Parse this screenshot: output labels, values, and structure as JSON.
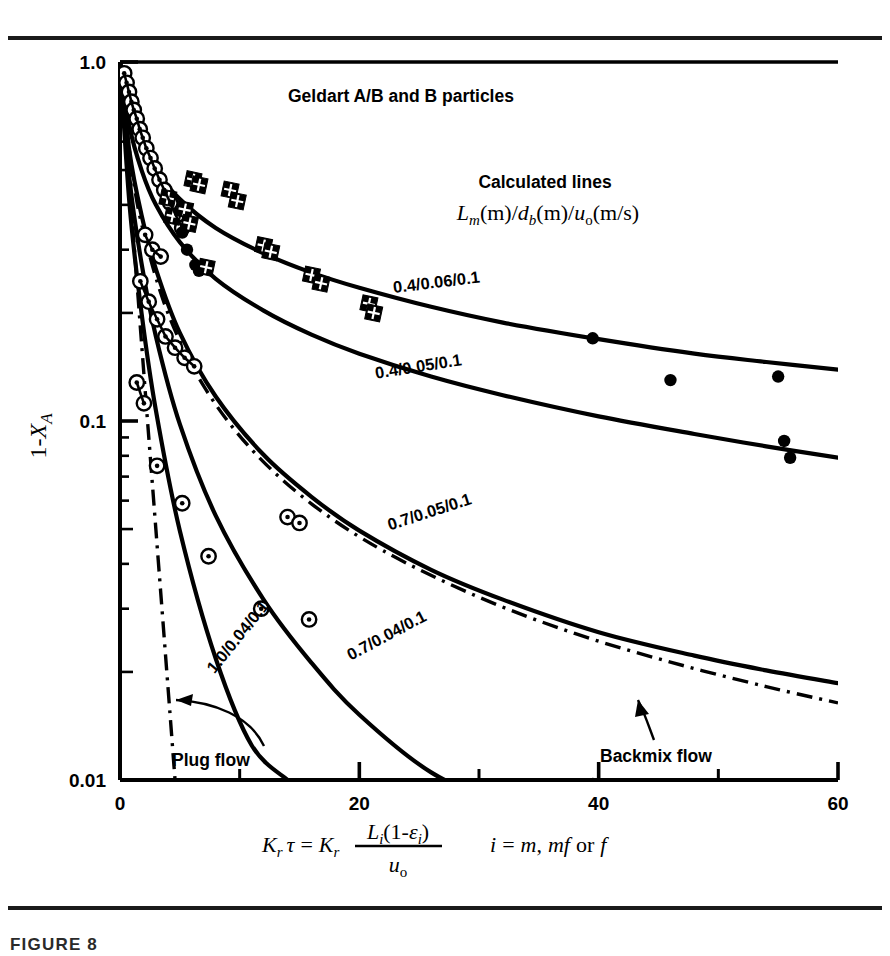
{
  "figure": {
    "caption": "FIGURE 8"
  },
  "chart_data": {
    "type": "scatter",
    "title": "Geldart A/B and B particles",
    "xlabel": "Kr tau = Kr Li(1-epsilon_i)/uo,  i = m, mf or f",
    "ylabel": "1-XA",
    "xscale": "linear",
    "yscale": "log",
    "xlim": [
      0,
      60
    ],
    "ylim": [
      0.01,
      1.0
    ],
    "grid": false,
    "x_ticks_major": [
      "0",
      "20",
      "40",
      "60"
    ],
    "x_tick_values_major": [
      0,
      20,
      40,
      60
    ],
    "x_ticks_minor": [
      10,
      30,
      50
    ],
    "y_ticks_major": [
      "1.0",
      "0.1",
      "0.01"
    ],
    "y_tick_values_major": [
      1.0,
      0.1,
      0.01
    ],
    "legend_heading": "Calculated lines",
    "legend_formula": "Lm(m)/db(m)/uo(m/s)",
    "annotations": {
      "plug_flow": "Plug flow",
      "backmix_flow": "Backmix flow"
    },
    "series": [
      {
        "name": "0.4/0.06/0.1",
        "kind": "calculated-line",
        "label": "0.4/0.06/0.1",
        "label_x": 26.5,
        "label_y": 0.235,
        "label_rotation": -7,
        "points": [
          {
            "x": 0.0,
            "y": 1.0
          },
          {
            "x": 0.8,
            "y": 0.74
          },
          {
            "x": 1.8,
            "y": 0.6
          },
          {
            "x": 3.0,
            "y": 0.5
          },
          {
            "x": 5.0,
            "y": 0.415
          },
          {
            "x": 8.0,
            "y": 0.345
          },
          {
            "x": 12.0,
            "y": 0.293
          },
          {
            "x": 16.0,
            "y": 0.259
          },
          {
            "x": 20.0,
            "y": 0.235
          },
          {
            "x": 26.0,
            "y": 0.208
          },
          {
            "x": 32.0,
            "y": 0.188
          },
          {
            "x": 40.0,
            "y": 0.169
          },
          {
            "x": 48.0,
            "y": 0.154
          },
          {
            "x": 54.0,
            "y": 0.146
          },
          {
            "x": 60.0,
            "y": 0.139
          }
        ]
      },
      {
        "name": "0.4/0.05/0.1",
        "kind": "calculated-line",
        "label": "0.4/0.05/0.1",
        "label_x": 25.0,
        "label_y": 0.137,
        "label_rotation": -9,
        "points": [
          {
            "x": 0.0,
            "y": 1.0
          },
          {
            "x": 0.8,
            "y": 0.66
          },
          {
            "x": 1.8,
            "y": 0.5
          },
          {
            "x": 3.0,
            "y": 0.4
          },
          {
            "x": 5.0,
            "y": 0.315
          },
          {
            "x": 8.0,
            "y": 0.249
          },
          {
            "x": 12.0,
            "y": 0.203
          },
          {
            "x": 16.0,
            "y": 0.174
          },
          {
            "x": 20.0,
            "y": 0.154
          },
          {
            "x": 26.0,
            "y": 0.133
          },
          {
            "x": 32.0,
            "y": 0.118
          },
          {
            "x": 40.0,
            "y": 0.103
          },
          {
            "x": 48.0,
            "y": 0.092
          },
          {
            "x": 54.0,
            "y": 0.085
          },
          {
            "x": 60.0,
            "y": 0.079
          }
        ]
      },
      {
        "name": "0.7/0.05/0.1",
        "kind": "calculated-line",
        "label": "0.7/0.05/0.1",
        "label_x": 26.0,
        "label_y": 0.054,
        "label_rotation": -18,
        "points": [
          {
            "x": 0.0,
            "y": 1.0
          },
          {
            "x": 0.8,
            "y": 0.56
          },
          {
            "x": 1.8,
            "y": 0.375
          },
          {
            "x": 3.0,
            "y": 0.265
          },
          {
            "x": 5.0,
            "y": 0.176
          },
          {
            "x": 8.0,
            "y": 0.117
          },
          {
            "x": 12.0,
            "y": 0.0805
          },
          {
            "x": 16.0,
            "y": 0.0615
          },
          {
            "x": 20.0,
            "y": 0.0495
          },
          {
            "x": 26.0,
            "y": 0.0385
          },
          {
            "x": 32.0,
            "y": 0.0318
          },
          {
            "x": 40.0,
            "y": 0.0258
          },
          {
            "x": 48.0,
            "y": 0.0222
          },
          {
            "x": 54.0,
            "y": 0.0202
          },
          {
            "x": 60.0,
            "y": 0.0186
          }
        ]
      },
      {
        "name": "0.7/0.04/0.1",
        "kind": "calculated-line",
        "label": "0.7/0.04/0.1",
        "label_x": 22.5,
        "label_y": 0.0245,
        "label_rotation": -28,
        "points": [
          {
            "x": 0.0,
            "y": 1.0
          },
          {
            "x": 0.8,
            "y": 0.47
          },
          {
            "x": 1.8,
            "y": 0.275
          },
          {
            "x": 3.0,
            "y": 0.172
          },
          {
            "x": 5.0,
            "y": 0.098
          },
          {
            "x": 8.0,
            "y": 0.0545
          },
          {
            "x": 12.0,
            "y": 0.0318
          },
          {
            "x": 16.0,
            "y": 0.0212
          },
          {
            "x": 20.0,
            "y": 0.0152
          },
          {
            "x": 26.0,
            "y": 0.0105
          },
          {
            "x": 31.0,
            "y": 0.0082
          },
          {
            "x": 36.0,
            "y": 0.0066
          },
          {
            "x": 39.5,
            "y": 0.01
          }
        ]
      },
      {
        "name": "1.0/0.04/0.1",
        "kind": "calculated-line",
        "label": "1.0/0.04/0.1",
        "label_x": 10.2,
        "label_y": 0.0245,
        "label_rotation": -51,
        "points": [
          {
            "x": 0.0,
            "y": 1.0
          },
          {
            "x": 0.8,
            "y": 0.4
          },
          {
            "x": 1.8,
            "y": 0.2
          },
          {
            "x": 3.0,
            "y": 0.107
          },
          {
            "x": 5.0,
            "y": 0.0495
          },
          {
            "x": 8.0,
            "y": 0.0218
          },
          {
            "x": 11.0,
            "y": 0.0125
          },
          {
            "x": 14.0,
            "y": 0.01
          }
        ]
      },
      {
        "name": "Plug flow",
        "kind": "reference-dashdot",
        "label": "Plug flow",
        "points": [
          {
            "x": 0.0,
            "y": 1.0
          },
          {
            "x": 1.0,
            "y": 0.37
          },
          {
            "x": 2.0,
            "y": 0.135
          },
          {
            "x": 3.0,
            "y": 0.0498
          },
          {
            "x": 4.0,
            "y": 0.0183
          },
          {
            "x": 4.6,
            "y": 0.01
          }
        ]
      },
      {
        "name": "Backmix flow",
        "kind": "reference-dashdot",
        "label": "Backmix flow",
        "points": [
          {
            "x": 0.0,
            "y": 1.0
          },
          {
            "x": 1.0,
            "y": 0.5
          },
          {
            "x": 2.0,
            "y": 0.333
          },
          {
            "x": 4.0,
            "y": 0.2
          },
          {
            "x": 7.0,
            "y": 0.125
          },
          {
            "x": 11.0,
            "y": 0.0833
          },
          {
            "x": 16.0,
            "y": 0.0588
          },
          {
            "x": 22.0,
            "y": 0.0435
          },
          {
            "x": 30.0,
            "y": 0.0323
          },
          {
            "x": 38.0,
            "y": 0.0256
          },
          {
            "x": 46.0,
            "y": 0.0213
          },
          {
            "x": 54.0,
            "y": 0.0182
          },
          {
            "x": 60.0,
            "y": 0.0164
          }
        ]
      },
      {
        "name": "open-circle data",
        "kind": "marker-open-circle",
        "points": [
          {
            "x": 0.35,
            "y": 0.93
          },
          {
            "x": 0.55,
            "y": 0.875
          },
          {
            "x": 0.75,
            "y": 0.825
          },
          {
            "x": 0.95,
            "y": 0.775
          },
          {
            "x": 1.15,
            "y": 0.735
          },
          {
            "x": 1.4,
            "y": 0.695
          },
          {
            "x": 1.65,
            "y": 0.65
          },
          {
            "x": 1.9,
            "y": 0.615
          },
          {
            "x": 2.2,
            "y": 0.575
          },
          {
            "x": 2.55,
            "y": 0.54
          },
          {
            "x": 2.9,
            "y": 0.505
          },
          {
            "x": 3.3,
            "y": 0.47
          },
          {
            "x": 3.7,
            "y": 0.44
          },
          {
            "x": 4.2,
            "y": 0.405
          },
          {
            "x": 4.7,
            "y": 0.372
          },
          {
            "x": 5.2,
            "y": 0.345
          },
          {
            "x": 2.1,
            "y": 0.33
          },
          {
            "x": 2.7,
            "y": 0.3
          },
          {
            "x": 3.4,
            "y": 0.287
          },
          {
            "x": 1.7,
            "y": 0.245
          },
          {
            "x": 2.4,
            "y": 0.215
          },
          {
            "x": 3.1,
            "y": 0.192
          },
          {
            "x": 3.8,
            "y": 0.172
          },
          {
            "x": 4.6,
            "y": 0.16
          },
          {
            "x": 5.4,
            "y": 0.15
          },
          {
            "x": 6.2,
            "y": 0.142
          },
          {
            "x": 1.4,
            "y": 0.128
          },
          {
            "x": 2.0,
            "y": 0.112
          },
          {
            "x": 3.1,
            "y": 0.075
          },
          {
            "x": 5.2,
            "y": 0.059
          },
          {
            "x": 14.0,
            "y": 0.054
          },
          {
            "x": 15.0,
            "y": 0.052
          },
          {
            "x": 7.4,
            "y": 0.042
          },
          {
            "x": 11.8,
            "y": 0.03
          },
          {
            "x": 15.8,
            "y": 0.028
          }
        ]
      },
      {
        "name": "filled-circle data",
        "kind": "marker-filled-circle",
        "points": [
          {
            "x": 5.2,
            "y": 0.335
          },
          {
            "x": 5.6,
            "y": 0.3
          },
          {
            "x": 6.3,
            "y": 0.272
          },
          {
            "x": 6.6,
            "y": 0.262
          },
          {
            "x": 39.5,
            "y": 0.17
          },
          {
            "x": 46.0,
            "y": 0.13
          },
          {
            "x": 55.0,
            "y": 0.133
          },
          {
            "x": 55.5,
            "y": 0.088
          },
          {
            "x": 56.0,
            "y": 0.079
          }
        ]
      },
      {
        "name": "crossed-square data",
        "kind": "marker-crossed-square",
        "points": [
          {
            "x": 4.0,
            "y": 0.418
          },
          {
            "x": 4.4,
            "y": 0.372
          },
          {
            "x": 6.1,
            "y": 0.47
          },
          {
            "x": 6.6,
            "y": 0.455
          },
          {
            "x": 5.4,
            "y": 0.388
          },
          {
            "x": 5.8,
            "y": 0.355
          },
          {
            "x": 9.2,
            "y": 0.44
          },
          {
            "x": 9.8,
            "y": 0.41
          },
          {
            "x": 12.0,
            "y": 0.308
          },
          {
            "x": 12.6,
            "y": 0.296
          },
          {
            "x": 16.0,
            "y": 0.255
          },
          {
            "x": 16.8,
            "y": 0.242
          },
          {
            "x": 7.2,
            "y": 0.268
          },
          {
            "x": 20.8,
            "y": 0.212
          },
          {
            "x": 21.2,
            "y": 0.2
          }
        ]
      }
    ]
  }
}
